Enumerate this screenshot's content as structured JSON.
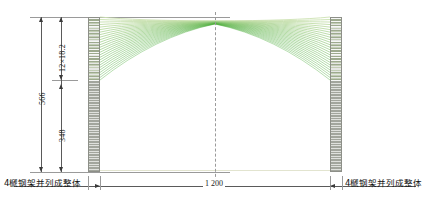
{
  "drawing": {
    "type": "structural-elevation",
    "description": "Arched steel frame elevation with dimension chain",
    "centerline_label": ""
  },
  "dimensions": {
    "overall_height": "566",
    "arch_rise": "12×18.2",
    "column_height": "348",
    "span": "1 200"
  },
  "notes": {
    "left": "4榹钢架并列成整体",
    "right": "4榹钢架并列成整体"
  },
  "colors": {
    "arc_light": "#cfe3b4",
    "arc_dark": "#6aa92a",
    "column_fill": "#b9bcb4",
    "column_stroke": "#8d8f88",
    "dimension_line": "#5a5a5a",
    "centerline": "#9a9a9a",
    "ground": "#e2e4cf"
  },
  "geometry": {
    "rib_count": 26,
    "left_column_x": 88,
    "right_column_x": 330,
    "column_width": 12,
    "column_top_y": 17,
    "column_base_y": 172,
    "apex_y": 21,
    "springing_y": 80
  },
  "chart_data": {
    "type": "line",
    "title": "",
    "xlabel": "",
    "ylabel": "",
    "series": [
      {
        "name": "arch-ribs",
        "description": "Fan of arch rib members springing from column tops to crown"
      }
    ]
  }
}
